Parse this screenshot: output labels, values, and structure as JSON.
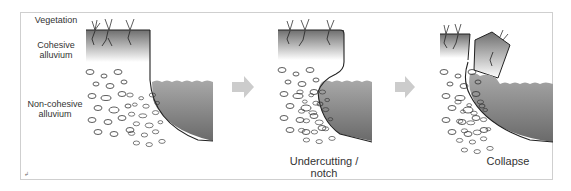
{
  "labels": {
    "vegetation": "Vegetation",
    "cohesive_line1": "Cohesive",
    "cohesive_line2": "alluvium",
    "noncohesive_line1": "Non-cohesive",
    "noncohesive_line2": "alluvium"
  },
  "captions": {
    "stage2_line1": "Undercutting /",
    "stage2_line2": "notch",
    "stage3": "Collapse"
  },
  "corner_mark": "↲",
  "colors": {
    "water_top": "#9a9a9a",
    "water_bottom": "#6a6a6a",
    "soil_top": "#777777",
    "arrow": "#cccccc",
    "frame": "#cfcfcf"
  }
}
